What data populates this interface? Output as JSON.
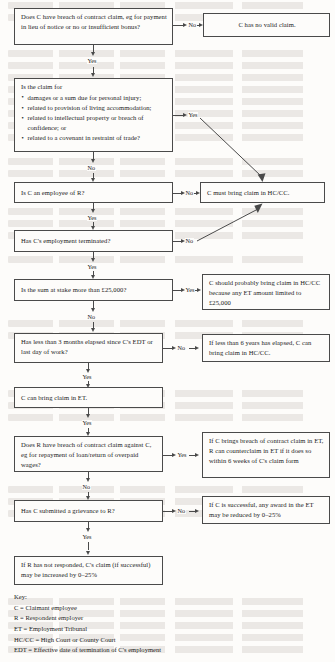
{
  "diagram": {
    "nodes": [
      {
        "id": "q1",
        "text": "Does C have breach of contract claim, eg for payment in lieu of notice or no or insufficient bonus?"
      },
      {
        "id": "o1",
        "text": "C has no valid claim."
      },
      {
        "id": "q2_lead",
        "text": "Is the claim for",
        "bullets": [
          "damages or a sum due for personal injury;",
          "related to provision of living accommodation;",
          "related to intellectual property or breach of confidence; or",
          "related to a covenant in restraint of trade?"
        ]
      },
      {
        "id": "q3",
        "text": "Is C an employee of R?"
      },
      {
        "id": "o2",
        "text": "C must bring claim in HC/CC."
      },
      {
        "id": "q4",
        "text": "Has C's employment terminated?"
      },
      {
        "id": "q5",
        "text": "Is the sum at stake more than £25,000?"
      },
      {
        "id": "o3",
        "text": "C should probably bring claim in HC/CC because any ET amount limited  to £25,000"
      },
      {
        "id": "q6",
        "text": "Has less than 3 months elapsed since C's EDT or last day of work?"
      },
      {
        "id": "o4",
        "text": "If less than 6 years has elapsed, C can bring claim in HC/CC."
      },
      {
        "id": "s1",
        "text": "C can bring claim in ET."
      },
      {
        "id": "q7",
        "text": "Does R have breach of contract claim against C, eg for repayment of loan/return of overpaid wages?"
      },
      {
        "id": "o5",
        "text": "If C brings  breach of contract claim in ET, R can counterclaim in ET if it does so within 6 weeks of C's claim form"
      },
      {
        "id": "q8",
        "text": "Has C submitted a grievance to R?"
      },
      {
        "id": "o6",
        "text": "If C is successful, any award in the ET may be reduced by 0–25%"
      },
      {
        "id": "s2",
        "text": "If R has not responded, C's claim (if successful) may be increased by 0–25%"
      }
    ],
    "edge_labels": {
      "e1_no": "No",
      "e1_yes": "Yes",
      "e2_yes": "Yes",
      "e2_no": "No",
      "e3_no": "No",
      "e3_yes": "Yes",
      "e4_no": "No",
      "e4_yes": "Yes",
      "e5_yes": "Yes",
      "e5_no": "No",
      "e6_no": "No",
      "e6_yes": "Yes",
      "e7_yes2": "Yes",
      "e7_yes": "Yes",
      "e7_no": "No",
      "e8_no": "No",
      "e8_yes": "Yes"
    }
  },
  "key": {
    "title": "Key:",
    "entries": [
      "C = Claimant employee",
      "R = Respondent employer",
      "ET = Employment Tribunal",
      "HC/CC = High Court or County Court",
      "EDT = Effective date of termination of C's employment"
    ]
  },
  "colors": {
    "ink": "#1a1a1a",
    "rule": "#4a4a4a",
    "paper": "#fdfcfa"
  }
}
